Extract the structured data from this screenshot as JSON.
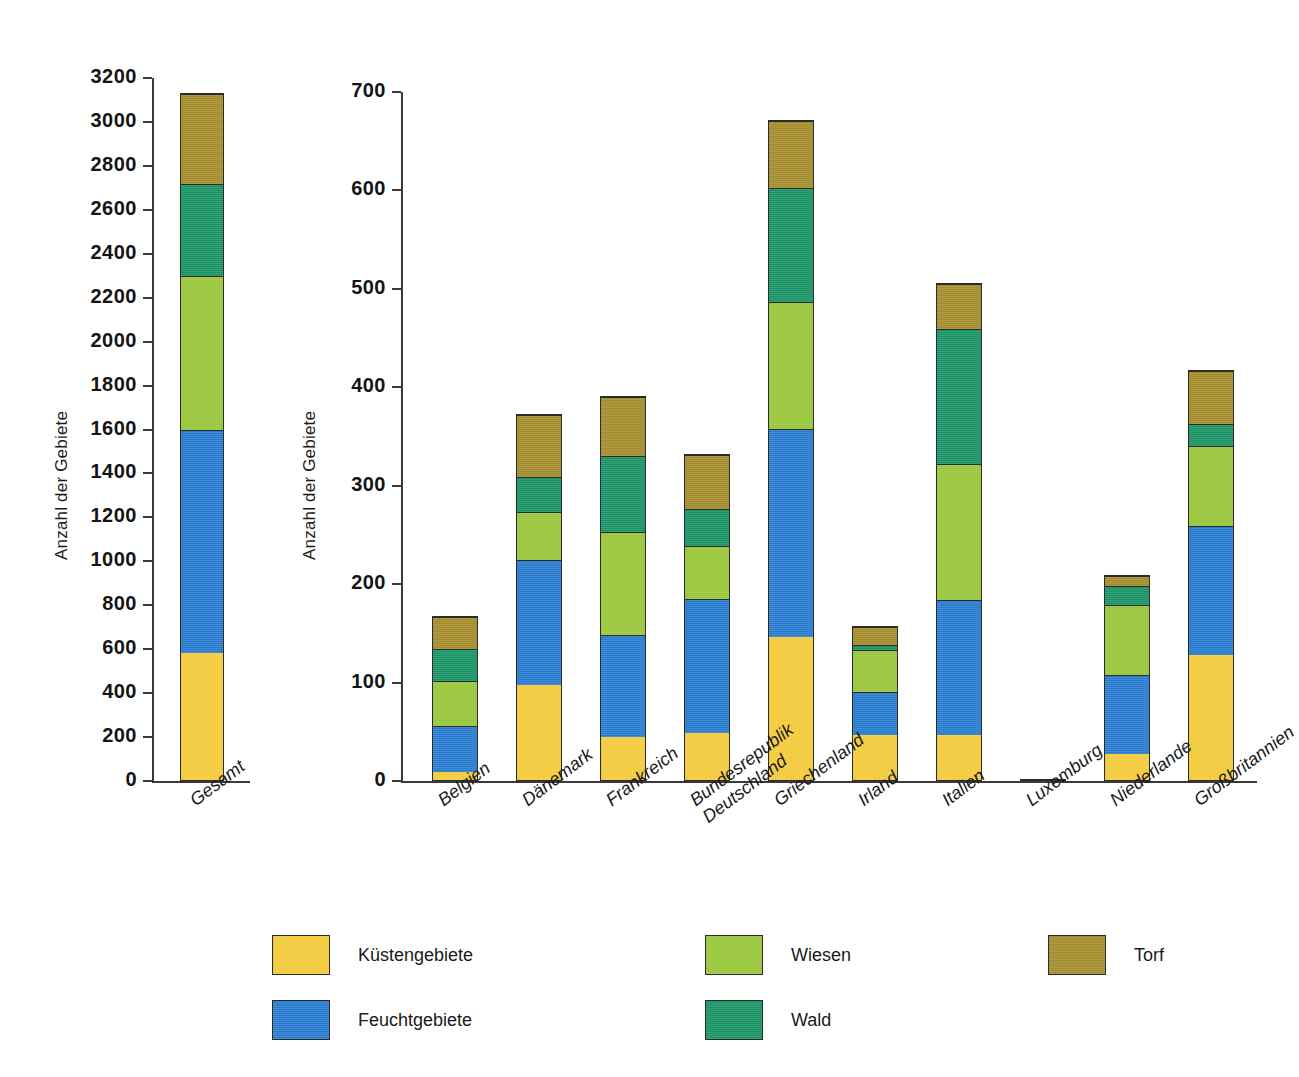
{
  "colors": {
    "kuesten": "#f8cf3c",
    "feucht": "#2a7fd4",
    "wiesen": "#9ccb3b",
    "wald": "#1c9768",
    "torf": "#a8902f",
    "axis": "#3a3a3a",
    "text": "#1a1a1a"
  },
  "legend": {
    "items": [
      {
        "label": "Küstengebiete",
        "key": "kuesten"
      },
      {
        "label": "Feuchtgebiete",
        "key": "feucht"
      },
      {
        "label": "Wiesen",
        "key": "wiesen"
      },
      {
        "label": "Wald",
        "key": "wald"
      },
      {
        "label": "Torf",
        "key": "torf"
      }
    ]
  },
  "chart_data": [
    {
      "type": "bar",
      "id": "total",
      "stacked": true,
      "title": "",
      "xlabel": "",
      "ylabel": "Anzahl der Gebiete",
      "ylim": [
        0,
        3200
      ],
      "ytick_step": 200,
      "yticks": [
        "0",
        "200",
        "400",
        "600",
        "800",
        "1000",
        "1200",
        "1400",
        "1600",
        "1800",
        "2000",
        "2200",
        "2400",
        "2600",
        "2800",
        "3000",
        "3200"
      ],
      "grid": false,
      "legend_position": "bottom",
      "categories": [
        "Gesamt"
      ],
      "series": [
        {
          "name": "Küstengebiete",
          "values": [
            580
          ]
        },
        {
          "name": "Feuchtgebiete",
          "values": [
            1020
          ]
        },
        {
          "name": "Wiesen",
          "values": [
            700
          ]
        },
        {
          "name": "Wald",
          "values": [
            420
          ]
        },
        {
          "name": "Torf",
          "values": [
            410
          ]
        }
      ],
      "totals": [
        3130
      ]
    },
    {
      "type": "bar",
      "id": "by-country",
      "stacked": true,
      "title": "",
      "xlabel": "",
      "ylabel": "Anzahl der Gebiete",
      "ylim": [
        0,
        700
      ],
      "ytick_step": 100,
      "yticks": [
        "0",
        "100",
        "200",
        "300",
        "400",
        "500",
        "600",
        "700"
      ],
      "grid": false,
      "legend_position": "bottom",
      "categories": [
        "Belgien",
        "Dänemark",
        "Frankreich",
        "Bundesrepublik Deutschland",
        "Griechenland",
        "Irland",
        "Italien",
        "Luxemburg",
        "Niederlande",
        "Großbritannien"
      ],
      "category_lines": [
        [
          "Belgien"
        ],
        [
          "Dänemark"
        ],
        [
          "Frankreich"
        ],
        [
          "Bundesrepublik",
          "Deutschland"
        ],
        [
          "Griechenland"
        ],
        [
          "Irland"
        ],
        [
          "Italien"
        ],
        [
          "Luxemburg"
        ],
        [
          "Niederlande"
        ],
        [
          "Großbritannien"
        ]
      ],
      "series": [
        {
          "name": "Küstengebiete",
          "values": [
            8,
            97,
            44,
            48,
            146,
            46,
            46,
            0,
            27,
            128
          ]
        },
        {
          "name": "Feuchtgebiete",
          "values": [
            48,
            128,
            104,
            137,
            212,
            45,
            138,
            1,
            81,
            131
          ]
        },
        {
          "name": "Wiesen",
          "values": [
            46,
            49,
            105,
            54,
            129,
            43,
            138,
            0,
            72,
            82
          ]
        },
        {
          "name": "Wald",
          "values": [
            33,
            36,
            78,
            38,
            116,
            5,
            138,
            0,
            19,
            22
          ]
        },
        {
          "name": "Torf",
          "values": [
            33,
            63,
            60,
            55,
            69,
            18,
            46,
            0,
            10,
            55
          ]
        }
      ],
      "totals": [
        168,
        373,
        391,
        332,
        672,
        157,
        506,
        1,
        209,
        418
      ]
    }
  ]
}
